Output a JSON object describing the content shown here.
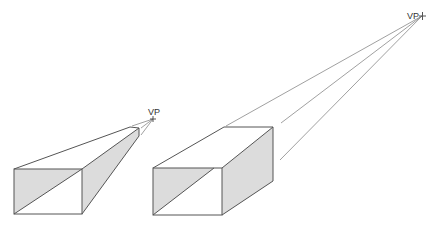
{
  "diagram": {
    "title": "",
    "colors": {
      "background": "#ffffff",
      "edge": "#555555",
      "guide": "#777777",
      "shade": "#dcdcdc",
      "label": "#333333"
    },
    "vanishing_points": [
      {
        "id": "vp-left",
        "label": "VP",
        "x": 153,
        "y": 119
      },
      {
        "id": "vp-right",
        "label": "VP",
        "x": 422,
        "y": 16
      }
    ],
    "boxes": [
      {
        "id": "box-left",
        "vanishing_point": "vp-left",
        "front_face": {
          "x1": 14,
          "y1": 169,
          "x2": 82,
          "y2": 214
        },
        "back_corners": {
          "top_left": [
            130,
            127
          ],
          "top_right": [
            139,
            128
          ],
          "bottom_right": [
            139,
            136
          ]
        }
      },
      {
        "id": "box-right",
        "vanishing_point": "vp-right",
        "front_face": {
          "x1": 153,
          "y1": 168,
          "x2": 222,
          "y2": 215
        },
        "back_corners": {
          "top_left": [
            224,
            127
          ],
          "top_right": [
            273,
            127
          ],
          "bottom_right": [
            273,
            181
          ]
        }
      }
    ]
  }
}
